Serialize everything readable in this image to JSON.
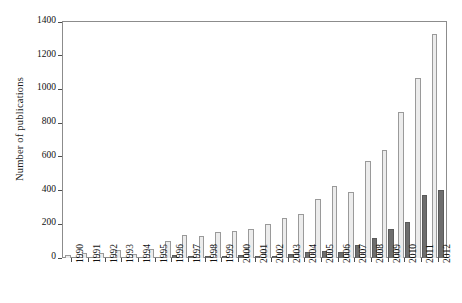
{
  "chart_data": {
    "type": "bar",
    "title": "",
    "xlabel": "",
    "ylabel": "Number of publications",
    "ylim": [
      0,
      1400
    ],
    "ytick_values": [
      0,
      200,
      400,
      600,
      800,
      1000,
      1200,
      1400
    ],
    "ytick_labels": [
      "0",
      "200",
      "400",
      "600",
      "800",
      "1000",
      "1200",
      "1400"
    ],
    "grid": false,
    "legend": "none",
    "categories": [
      "1990",
      "1991",
      "1992",
      "1993",
      "1994",
      "1995",
      "1996",
      "1997",
      "1998",
      "1999",
      "2000",
      "2001",
      "2002",
      "2003",
      "2004",
      "2005",
      "2006",
      "2007",
      "2008",
      "2009",
      "2010",
      "2011",
      "2012"
    ],
    "series": [
      {
        "name": "light",
        "color": "#ececec",
        "edge_color": "#9a9a9a",
        "values": [
          20,
          32,
          30,
          48,
          24,
          55,
          98,
          135,
          128,
          152,
          160,
          170,
          200,
          235,
          262,
          352,
          430,
          392,
          575,
          640,
          865,
          1065,
          1330
        ]
      },
      {
        "name": "dark",
        "color": "#6e6e6e",
        "edge_color": "#5a5a5a",
        "values": [
          0,
          0,
          0,
          0,
          0,
          0,
          18,
          12,
          8,
          10,
          18,
          14,
          14,
          22,
          34,
          44,
          36,
          78,
          118,
          170,
          215,
          375,
          405
        ]
      }
    ]
  }
}
